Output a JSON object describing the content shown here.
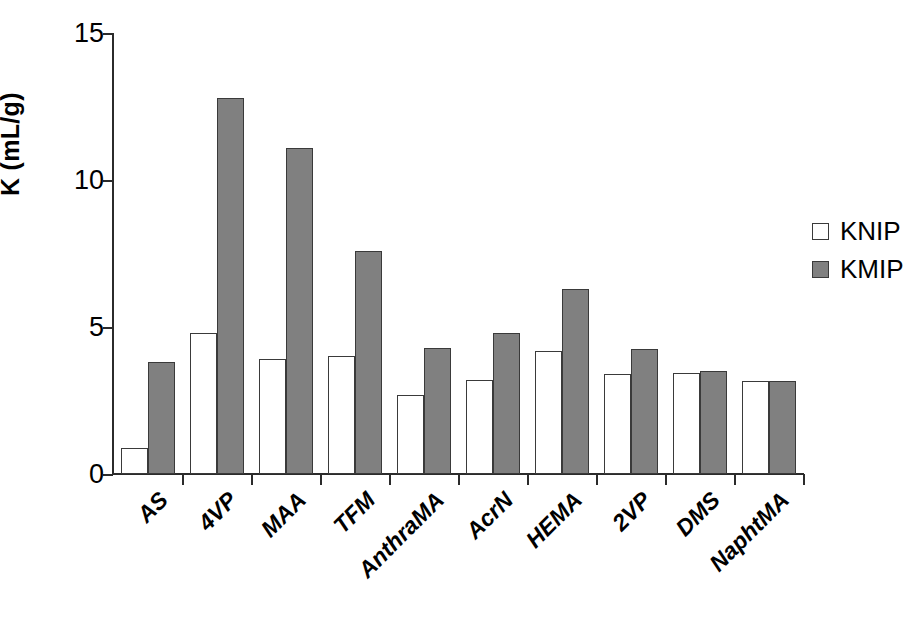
{
  "chart_data": {
    "type": "bar",
    "title": "",
    "xlabel": "",
    "ylabel": "K (mL/g)",
    "ylim": [
      0,
      15
    ],
    "yticks": [
      0,
      5,
      10,
      15
    ],
    "ytick_labels": [
      "0",
      "5",
      "10",
      "15"
    ],
    "grid": false,
    "legend_position": "right",
    "categories": [
      "AS",
      "4VP",
      "MAA",
      "TFM",
      "AnthraMA",
      "AcrN",
      "HEMA",
      "2VP",
      "DMS",
      "NaphtMA"
    ],
    "series": [
      {
        "name": "KNIP",
        "color": "#ffffff",
        "values": [
          0.9,
          4.8,
          3.9,
          4.0,
          2.7,
          3.2,
          4.2,
          3.4,
          3.45,
          3.15
        ]
      },
      {
        "name": "KMIP",
        "color": "#808080",
        "values": [
          3.8,
          12.8,
          11.1,
          7.6,
          4.3,
          4.8,
          6.3,
          4.25,
          3.5,
          3.15
        ]
      }
    ]
  },
  "legend": {
    "entries": [
      {
        "label": "KNIP",
        "swatch": "white-square-icon"
      },
      {
        "label": "KMIP",
        "swatch": "gray-square-icon"
      }
    ]
  },
  "colors": {
    "axis": "#2b2b2b",
    "bar_outline": "#3a3a3a",
    "knip_fill": "#ffffff",
    "kmip_fill": "#808080",
    "background": "#ffffff"
  }
}
